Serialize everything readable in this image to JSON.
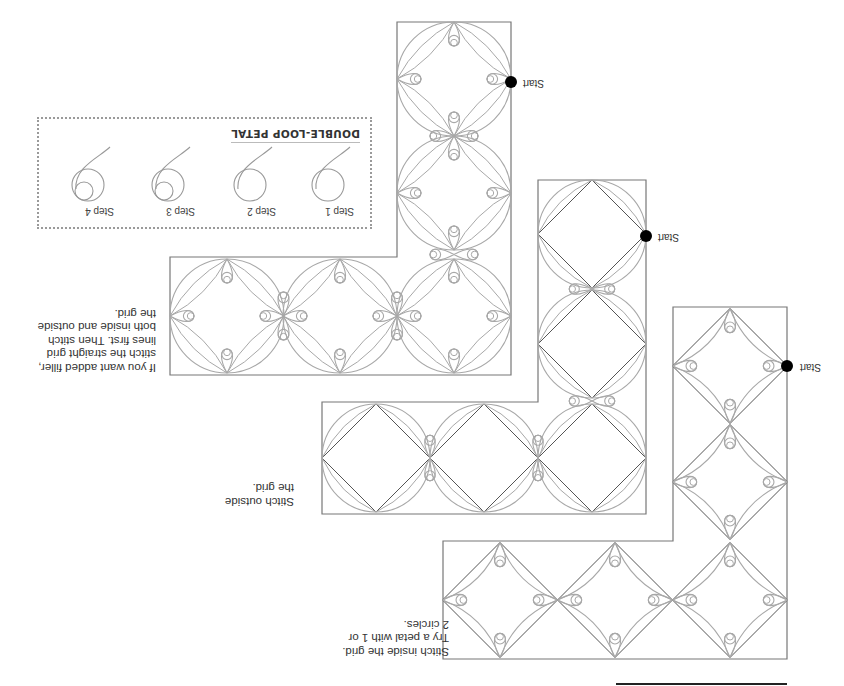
{
  "orientation": "rotated-180",
  "colors": {
    "outline": "#777777",
    "grid_line": "#555555",
    "stitch": "#a8a8a8",
    "start_dot": "#000000"
  },
  "start_label": "Start",
  "double_loop_petal": {
    "title": "DOUBLE-LOOP PETAL",
    "steps": [
      {
        "label": "Step 1",
        "loops": 1
      },
      {
        "label": "Step 2",
        "loops": 1
      },
      {
        "label": "Step 3",
        "loops": 2
      },
      {
        "label": "Step 4",
        "loops": 2
      }
    ]
  },
  "notes": {
    "filler": "If you want added filler,\nstitch the straight grid\nlines first. Then stitch\nboth inside and outside\nthe grid.",
    "outside": "Stitch outside\nthe grid.",
    "inside": "Stitch inside the grid.\nTry a petal with 1 or\n2 circles."
  },
  "borders": [
    {
      "name": "both-inside-and-outside",
      "style": "both",
      "outline": [
        [
          397,
          22
        ],
        [
          511,
          22
        ],
        [
          511,
          375
        ],
        [
          170,
          375
        ],
        [
          170,
          257
        ],
        [
          397,
          257
        ]
      ],
      "cells": [
        [
          454,
          79,
          114
        ],
        [
          454,
          193,
          114
        ],
        [
          454,
          316,
          114
        ],
        [
          340,
          316,
          114
        ],
        [
          227,
          316,
          114
        ]
      ],
      "start": [
        511,
        82
      ]
    },
    {
      "name": "outside-grid",
      "style": "outside",
      "outline": [
        [
          538,
          180
        ],
        [
          646,
          180
        ],
        [
          646,
          514
        ],
        [
          322,
          514
        ],
        [
          322,
          402
        ],
        [
          538,
          402
        ]
      ],
      "cells": [
        [
          592,
          234,
          108
        ],
        [
          592,
          344,
          108
        ],
        [
          592,
          458,
          108
        ],
        [
          484,
          458,
          108
        ],
        [
          376,
          458,
          108
        ]
      ],
      "start": [
        646,
        236
      ]
    },
    {
      "name": "inside-grid",
      "style": "inside",
      "outline": [
        [
          673,
          307
        ],
        [
          787,
          307
        ],
        [
          787,
          659
        ],
        [
          443,
          659
        ],
        [
          443,
          541
        ],
        [
          673,
          541
        ]
      ],
      "cells": [
        [
          730,
          366,
          115
        ],
        [
          730,
          482,
          115
        ],
        [
          730,
          600,
          115
        ],
        [
          615,
          600,
          115
        ],
        [
          500,
          600,
          115
        ]
      ],
      "start": [
        787,
        366
      ]
    }
  ],
  "bottom_rule": {
    "x1": 616,
    "x2": 787,
    "y": 684
  }
}
